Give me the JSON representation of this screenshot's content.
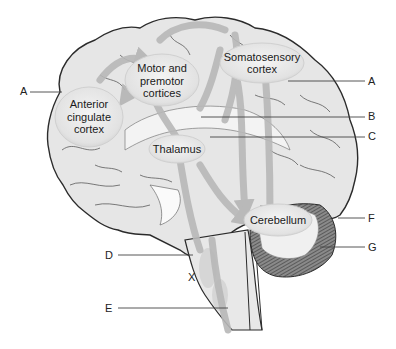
{
  "diagram": {
    "type": "brain-sagittal-pain-pathways",
    "regions": [
      {
        "id": "motor",
        "label": "Motor and\npremotor\ncortices"
      },
      {
        "id": "somato",
        "label": "Somatosensory\ncortex"
      },
      {
        "id": "acc",
        "label": "Anterior\ncingulate\ncortex"
      },
      {
        "id": "thalamus",
        "label": "Thalamus"
      },
      {
        "id": "cerebellum",
        "label": "Cerebellum"
      }
    ],
    "pointers": [
      {
        "id": "A-left",
        "letter": "A"
      },
      {
        "id": "A-right",
        "letter": "A"
      },
      {
        "id": "B",
        "letter": "B"
      },
      {
        "id": "C",
        "letter": "C"
      },
      {
        "id": "D",
        "letter": "D"
      },
      {
        "id": "E",
        "letter": "E"
      },
      {
        "id": "F",
        "letter": "F"
      },
      {
        "id": "G",
        "letter": "G"
      }
    ],
    "marker": "X",
    "colors": {
      "brain_fill": "#e4e4e4",
      "outline": "#2b2b2b",
      "sulci": "#555555",
      "pathway": "#b9b9b9",
      "bubble": "#ececec",
      "cerebellum_dark": "#555555",
      "leader_line": "#444444"
    }
  }
}
